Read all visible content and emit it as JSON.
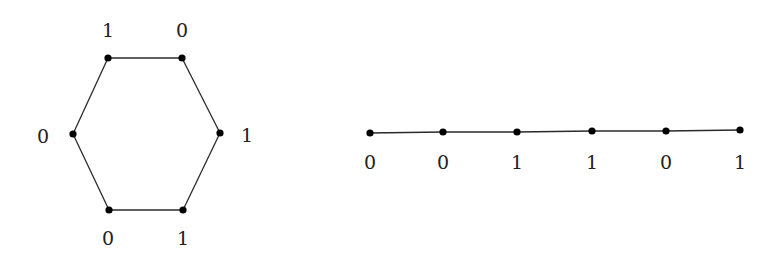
{
  "diagram": {
    "cycle": {
      "name": "hexagon",
      "vertices": [
        {
          "id": "c1",
          "x": 108,
          "y": 58,
          "label": "1",
          "lx": 108,
          "ly": 30
        },
        {
          "id": "c2",
          "x": 182,
          "y": 58,
          "label": "0",
          "lx": 182,
          "ly": 30
        },
        {
          "id": "c3",
          "x": 220,
          "y": 133,
          "label": "1",
          "lx": 247,
          "ly": 135
        },
        {
          "id": "c4",
          "x": 183,
          "y": 210,
          "label": "1",
          "lx": 183,
          "ly": 238
        },
        {
          "id": "c5",
          "x": 109,
          "y": 210,
          "label": "0",
          "lx": 108,
          "ly": 238
        },
        {
          "id": "c6",
          "x": 73,
          "y": 134,
          "label": "0",
          "lx": 43,
          "ly": 136
        }
      ],
      "edges": [
        [
          "c1",
          "c2"
        ],
        [
          "c2",
          "c3"
        ],
        [
          "c3",
          "c4"
        ],
        [
          "c4",
          "c5"
        ],
        [
          "c5",
          "c6"
        ],
        [
          "c6",
          "c1"
        ]
      ]
    },
    "path": {
      "name": "path",
      "vertices": [
        {
          "id": "p1",
          "x": 370,
          "y": 133,
          "label": "0",
          "lx": 370,
          "ly": 162
        },
        {
          "id": "p2",
          "x": 443,
          "y": 132,
          "label": "0",
          "lx": 443,
          "ly": 162
        },
        {
          "id": "p3",
          "x": 517,
          "y": 132,
          "label": "1",
          "lx": 517,
          "ly": 162
        },
        {
          "id": "p4",
          "x": 592,
          "y": 131,
          "label": "1",
          "lx": 592,
          "ly": 162
        },
        {
          "id": "p5",
          "x": 666,
          "y": 131,
          "label": "0",
          "lx": 666,
          "ly": 162
        },
        {
          "id": "p6",
          "x": 740,
          "y": 130,
          "label": "1",
          "lx": 740,
          "ly": 162
        }
      ],
      "edges": [
        [
          "p1",
          "p2"
        ],
        [
          "p2",
          "p3"
        ],
        [
          "p3",
          "p4"
        ],
        [
          "p4",
          "p5"
        ],
        [
          "p5",
          "p6"
        ]
      ]
    },
    "colors": {
      "edge": "#2a2a2a",
      "node": "#000000",
      "label": "#222222",
      "background": "#ffffff"
    }
  }
}
